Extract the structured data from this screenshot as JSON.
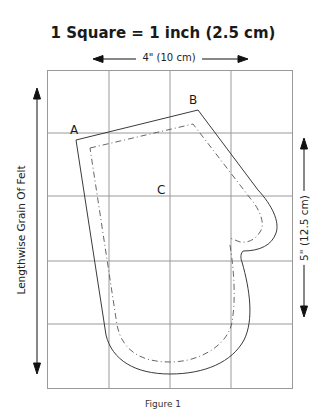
{
  "diagram": {
    "title": "1 Square = 1 inch (2.5 cm)",
    "width_dimension": "4\" (10 cm)",
    "height_dimension": "5\" (12.5 cm)",
    "grain_label": "Lengthwise Grain Of Felt",
    "figure_caption": "Figure 1",
    "points": [
      {
        "label": "A"
      },
      {
        "label": "B"
      },
      {
        "label": "C"
      }
    ],
    "grid": {
      "columns": 4,
      "rows": 5,
      "unit": "1 inch"
    },
    "lines": {
      "cut_line": "solid",
      "stitch_line": "dash-dot"
    },
    "colors": {
      "grid": "#9a9a9a",
      "outline": "#3a3a3a",
      "arrow": "#111111"
    }
  }
}
